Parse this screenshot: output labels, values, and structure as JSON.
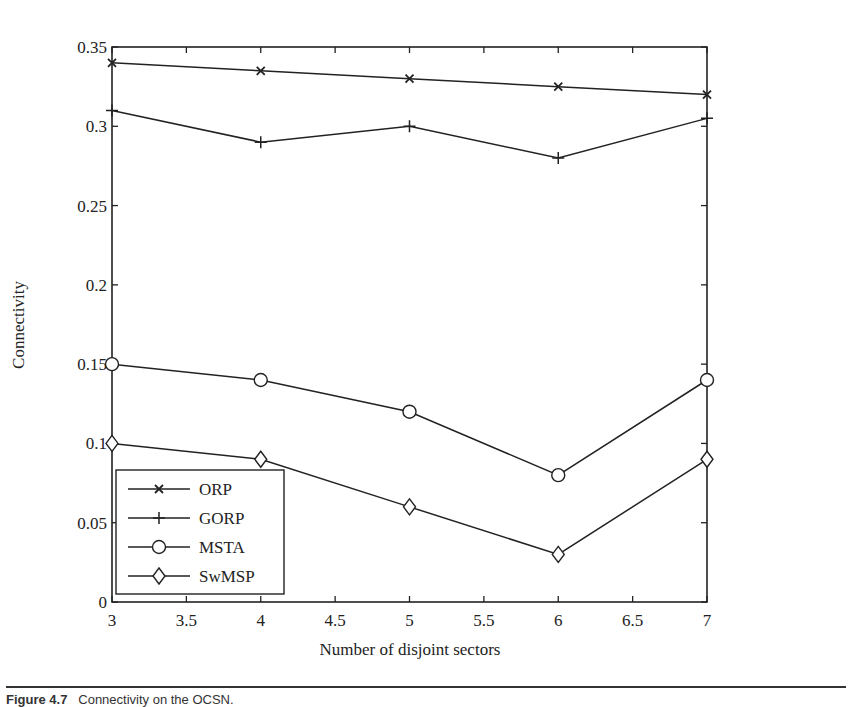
{
  "chart_data": {
    "type": "line",
    "title": "",
    "xlabel": "Number of disjoint sectors",
    "ylabel": "Connectivity",
    "x": [
      3,
      4,
      5,
      6,
      7
    ],
    "xlim": [
      3,
      7
    ],
    "ylim": [
      0,
      0.35
    ],
    "xticks": [
      3,
      3.5,
      4,
      4.5,
      5,
      5.5,
      6,
      6.5,
      7
    ],
    "xtick_labels": [
      "3",
      "3.5",
      "4",
      "4.5",
      "5",
      "5.5",
      "6",
      "6.5",
      "7"
    ],
    "yticks": [
      0,
      0.05,
      0.1,
      0.15,
      0.2,
      0.25,
      0.3,
      0.35
    ],
    "ytick_labels": [
      "0",
      "0.05",
      "0.1",
      "0.15",
      "0.2",
      "0.25",
      "0.3",
      "0.35"
    ],
    "grid": false,
    "legend_position": "lower left",
    "series": [
      {
        "name": "ORP",
        "marker": "x",
        "values": [
          0.34,
          0.335,
          0.33,
          0.325,
          0.32
        ]
      },
      {
        "name": "GORP",
        "marker": "plus",
        "values": [
          0.31,
          0.29,
          0.3,
          0.28,
          0.305
        ]
      },
      {
        "name": "MSTA",
        "marker": "circle",
        "values": [
          0.15,
          0.14,
          0.12,
          0.08,
          0.14
        ]
      },
      {
        "name": "SwMSP",
        "marker": "diamond",
        "values": [
          0.1,
          0.09,
          0.06,
          0.03,
          0.09
        ]
      }
    ]
  },
  "style": {
    "line_color": "#222222",
    "background": "#ffffff"
  },
  "caption": {
    "label": "Figure 4.7",
    "text": "Connectivity on the OCSN."
  }
}
